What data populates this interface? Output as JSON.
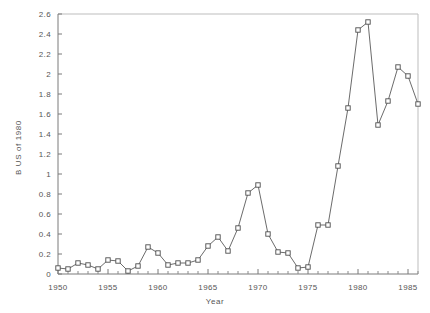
{
  "chart_data": {
    "type": "line",
    "title": "",
    "xlabel": "Year",
    "ylabel": "B US of 1980",
    "xlim": [
      1950,
      1986
    ],
    "ylim": [
      0,
      2.6
    ],
    "grid": false,
    "legend": null,
    "marker": "open-square",
    "xticks": [
      1950,
      1955,
      1960,
      1965,
      1970,
      1975,
      1980,
      1985
    ],
    "xtick_labels": [
      "1950",
      "1955",
      "1960",
      "1965",
      "1970",
      "1975",
      "1980",
      "1985"
    ],
    "x_minor_tick_step": 1,
    "yticks": [
      0,
      0.2,
      0.4,
      0.6,
      0.8,
      1,
      1.2,
      1.4,
      1.6,
      1.8,
      2,
      2.2,
      2.4,
      2.6
    ],
    "ytick_labels": [
      "0",
      "0.2",
      "0.4",
      "0.6",
      "0.8",
      "1",
      "1.2",
      "1.4",
      "1.6",
      "1.8",
      "2",
      "2.2",
      "2.4",
      "2.6"
    ],
    "x": [
      1950,
      1951,
      1952,
      1953,
      1954,
      1955,
      1956,
      1957,
      1958,
      1959,
      1960,
      1961,
      1962,
      1963,
      1964,
      1965,
      1966,
      1967,
      1968,
      1969,
      1970,
      1971,
      1972,
      1973,
      1974,
      1975,
      1976,
      1977,
      1978,
      1979,
      1980,
      1981,
      1982,
      1983,
      1984,
      1985,
      1986
    ],
    "values": [
      0.06,
      0.05,
      0.11,
      0.09,
      0.05,
      0.14,
      0.13,
      0.03,
      0.08,
      0.27,
      0.21,
      0.09,
      0.11,
      0.11,
      0.14,
      0.28,
      0.37,
      0.23,
      0.46,
      0.81,
      0.89,
      0.4,
      0.22,
      0.21,
      0.06,
      0.07,
      0.49,
      0.49,
      1.08,
      1.66,
      2.44,
      2.52,
      1.49,
      1.73,
      2.07,
      1.98,
      1.7
    ],
    "series_name": "B US of 1980"
  },
  "colors": {
    "background": "#ffffff",
    "axis": "#7a7a7a",
    "frame_light": "#bdbdbd",
    "line": "#5a5a5a",
    "marker_edge": "#4d4d4d",
    "marker_fill": "#ffffff",
    "text": "#555555"
  }
}
